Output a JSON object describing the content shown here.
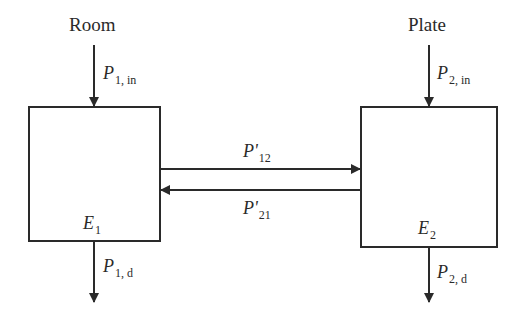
{
  "diagram": {
    "nodes": [
      {
        "id": "room",
        "title": "Room",
        "energy_symbol": "E",
        "energy_sub": "1",
        "input": {
          "symbol": "P",
          "sub": "1, in"
        },
        "dissipation": {
          "symbol": "P",
          "sub": "1, d"
        }
      },
      {
        "id": "plate",
        "title": "Plate",
        "energy_symbol": "E",
        "energy_sub": "2",
        "input": {
          "symbol": "P",
          "sub": "2, in"
        },
        "dissipation": {
          "symbol": "P",
          "sub": "2, d"
        }
      }
    ],
    "edges": [
      {
        "from": "room",
        "to": "plate",
        "symbol": "P'",
        "sub": "12"
      },
      {
        "from": "plate",
        "to": "room",
        "symbol": "P'",
        "sub": "21"
      }
    ],
    "colors": {
      "line": "#2a2a2a",
      "background": "#ffffff"
    }
  }
}
